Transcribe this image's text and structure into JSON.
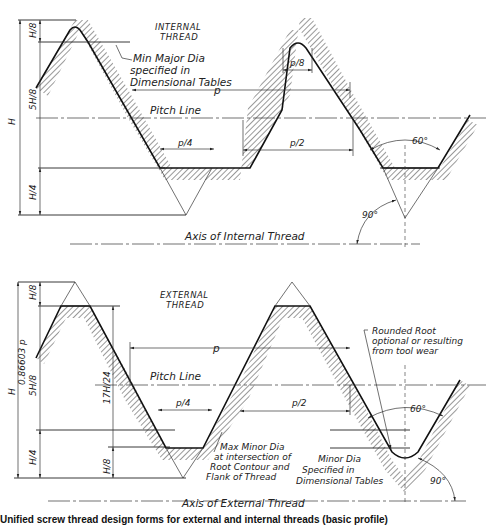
{
  "internal_thread": {
    "title_line1": "INTERNAL",
    "title_line2": "THREAD",
    "callout_major": [
      "Min Major Dia",
      "specified in",
      "Dimensional Tables"
    ],
    "pitch_label": "p",
    "pitch_line_label": "Pitch Line",
    "crest_flat_label": "p/8",
    "root_flat_label": "p/4",
    "half_pitch_label": "p/2",
    "angle_60": "60°",
    "angle_90": "90°",
    "axis_label": "Axis of Internal Thread",
    "dim_H": "H",
    "dim_H8": "H/8",
    "dim_5H8": "5H/8",
    "dim_H4": "H/4"
  },
  "external_thread": {
    "title_line1": "EXTERNAL",
    "title_line2": "THREAD",
    "pitch_label": "p",
    "pitch_line_label": "Pitch Line",
    "root_flat_label": "p/4",
    "half_pitch_label": "p/2",
    "angle_60": "60°",
    "angle_90": "90°",
    "axis_label": "Axis of External Thread",
    "rounded_root_callout": [
      "Rounded Root",
      "optional or resulting",
      "from tool wear"
    ],
    "max_minor_callout": [
      "Max Minor Dia",
      "at intersection of",
      "Root Contour and",
      "Flank of Thread"
    ],
    "minor_dia_callout": [
      "Minor Dia",
      "Specified in",
      "Dimensional Tables"
    ],
    "dim_H": "H",
    "dim_H_value": "0.86603 p",
    "dim_H8_top": "H/8",
    "dim_5H8": "5H/8",
    "dim_17H24": "17H/24",
    "dim_H4": "H/4",
    "dim_H8_root": "H/8"
  },
  "caption": "Unified screw thread design forms for external and internal threads (basic profile)"
}
